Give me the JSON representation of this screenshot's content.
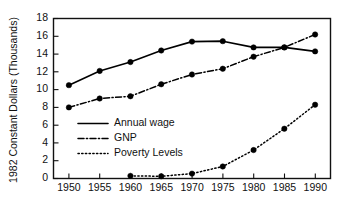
{
  "chart_data": {
    "type": "line",
    "title": "",
    "xlabel": "",
    "ylabel": "1982 Constant Dollars (Thousands)",
    "x": [
      1950,
      1955,
      1960,
      1965,
      1970,
      1975,
      1980,
      1985,
      1990
    ],
    "xticklabels": [
      "1950",
      "1955",
      "1960",
      "1965",
      "1970",
      "1975",
      "1980",
      "1985",
      "1990"
    ],
    "yticklabels": [
      "0",
      "2",
      "4",
      "6",
      "8",
      "10",
      "12",
      "14",
      "16",
      "18"
    ],
    "yticks": [
      0,
      2,
      4,
      6,
      8,
      10,
      12,
      14,
      16,
      18
    ],
    "xlim": [
      1947.5,
      1992.5
    ],
    "ylim": [
      0,
      18
    ],
    "grid": false,
    "legend_position": "center-left",
    "series": [
      {
        "name": "Annual wage",
        "style": "solid",
        "marker": "filled-circle",
        "x": [
          1950,
          1955,
          1960,
          1965,
          1970,
          1975,
          1980,
          1985,
          1990
        ],
        "values": [
          10.5,
          12.1,
          13.1,
          14.4,
          15.4,
          15.45,
          14.75,
          14.75,
          14.3
        ]
      },
      {
        "name": "GNP",
        "style": "dash-dot",
        "marker": "filled-circle",
        "x": [
          1950,
          1955,
          1960,
          1965,
          1970,
          1975,
          1980,
          1985,
          1990
        ],
        "values": [
          8.0,
          9.0,
          9.25,
          10.6,
          11.7,
          12.35,
          13.7,
          14.75,
          16.2
        ]
      },
      {
        "name": "Poverty Levels",
        "style": "dotted",
        "marker": "filled-circle",
        "x": [
          1960,
          1965,
          1970,
          1975,
          1980,
          1985,
          1990
        ],
        "values": [
          0.3,
          0.25,
          0.55,
          1.35,
          3.2,
          5.6,
          8.3
        ]
      }
    ],
    "colors": {
      "line": "#000000",
      "axis": "#111111",
      "background": "#ffffff",
      "text": "#111111"
    }
  },
  "legend": {
    "items": [
      {
        "label": "Annual wage"
      },
      {
        "label": "GNP"
      },
      {
        "label": "Poverty Levels"
      }
    ]
  },
  "axes": {
    "y_title": "1982 Constant Dollars (Thousands)"
  }
}
